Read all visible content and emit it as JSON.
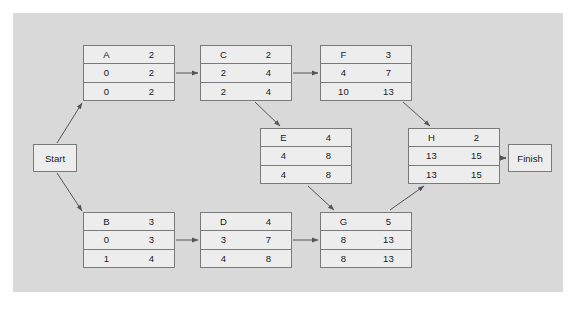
{
  "diagram": {
    "type": "pert-cpm-network",
    "canvas_color": "#d9d9d9",
    "node_fill": "#ededed",
    "node_border": "#7a7a7a",
    "arrow_color": "#555555"
  },
  "terminals": {
    "start": {
      "label": "Start",
      "x": 33,
      "y": 144
    },
    "finish": {
      "label": "Finish",
      "x": 508,
      "y": 144
    }
  },
  "nodes": [
    {
      "id": "A",
      "x": 83,
      "y": 45,
      "name": "A",
      "duration": "2",
      "early_start": "0",
      "early_finish": "2",
      "late_start": "0",
      "late_finish": "2"
    },
    {
      "id": "C",
      "x": 200,
      "y": 45,
      "name": "C",
      "duration": "2",
      "early_start": "2",
      "early_finish": "4",
      "late_start": "2",
      "late_finish": "4"
    },
    {
      "id": "F",
      "x": 320,
      "y": 45,
      "name": "F",
      "duration": "3",
      "early_start": "4",
      "early_finish": "7",
      "late_start": "10",
      "late_finish": "13"
    },
    {
      "id": "E",
      "x": 260,
      "y": 128,
      "name": "E",
      "duration": "4",
      "early_start": "4",
      "early_finish": "8",
      "late_start": "4",
      "late_finish": "8"
    },
    {
      "id": "H",
      "x": 408,
      "y": 128,
      "name": "H",
      "duration": "2",
      "early_start": "13",
      "early_finish": "15",
      "late_start": "13",
      "late_finish": "15"
    },
    {
      "id": "B",
      "x": 83,
      "y": 212,
      "name": "B",
      "duration": "3",
      "early_start": "0",
      "early_finish": "3",
      "late_start": "1",
      "late_finish": "4"
    },
    {
      "id": "D",
      "x": 200,
      "y": 212,
      "name": "D",
      "duration": "4",
      "early_start": "3",
      "early_finish": "7",
      "late_start": "4",
      "late_finish": "8"
    },
    {
      "id": "G",
      "x": 320,
      "y": 212,
      "name": "G",
      "duration": "5",
      "early_start": "8",
      "early_finish": "13",
      "late_start": "8",
      "late_finish": "13"
    }
  ],
  "edges": [
    {
      "from": "Start",
      "to": "A"
    },
    {
      "from": "Start",
      "to": "B"
    },
    {
      "from": "A",
      "to": "C"
    },
    {
      "from": "C",
      "to": "F"
    },
    {
      "from": "C",
      "to": "E"
    },
    {
      "from": "F",
      "to": "H"
    },
    {
      "from": "E",
      "to": "G"
    },
    {
      "from": "B",
      "to": "D"
    },
    {
      "from": "D",
      "to": "G"
    },
    {
      "from": "G",
      "to": "H"
    },
    {
      "from": "H",
      "to": "Finish"
    }
  ]
}
